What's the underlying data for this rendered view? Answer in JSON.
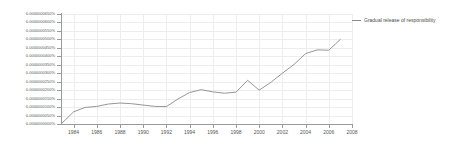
{
  "chart_data": {
    "type": "line",
    "title": "",
    "subtitle": "",
    "xlabel": "",
    "ylabel": "",
    "grid": true,
    "legend_position": "right",
    "xlim": [
      1983,
      2008
    ],
    "ylim": [
      0.0,
      6.5e-08
    ],
    "y_tick_labels": [
      "0.0000000650%",
      "0.0000000600%",
      "0.0000000550%",
      "0.0000000500%",
      "0.0000000450%",
      "0.0000000400%",
      "0.0000000350%",
      "0.0000000300%",
      "0.0000000250%",
      "0.0000000200%",
      "0.0000000150%",
      "0.0000000100%",
      "0.0000000050%",
      "0.0000000000%"
    ],
    "y_tick_values": [
      6.5e-08,
      6e-08,
      5.5e-08,
      5e-08,
      4.5e-08,
      4e-08,
      3.5e-08,
      3e-08,
      2.5e-08,
      2e-08,
      1.5e-08,
      1e-08,
      5e-09,
      0.0
    ],
    "x_tick_labels": [
      "1984",
      "1986",
      "1988",
      "1990",
      "1992",
      "1994",
      "1996",
      "1998",
      "2000",
      "2002",
      "2004",
      "2006",
      "2008"
    ],
    "x_tick_values": [
      1984,
      1986,
      1988,
      1990,
      1992,
      1994,
      1996,
      1998,
      2000,
      2002,
      2004,
      2006,
      2008
    ],
    "series": [
      {
        "name": "Gradual release of responsibility",
        "color": "#8a8a8a",
        "x": [
          1983,
          1984,
          1985,
          1986,
          1987,
          1988,
          1989,
          1990,
          1991,
          1992,
          1993,
          1994,
          1995,
          1996,
          1997,
          1998,
          1999,
          2000,
          2001,
          2002,
          2003,
          2004,
          2005,
          2006,
          2007
        ],
        "values": [
          5e-10,
          7.2e-09,
          9.8e-09,
          1.04e-08,
          1.18e-08,
          1.24e-08,
          1.2e-08,
          1.12e-08,
          1.04e-08,
          1.03e-08,
          1.48e-08,
          1.86e-08,
          2.03e-08,
          1.9e-08,
          1.82e-08,
          1.88e-08,
          2.58e-08,
          2e-08,
          2.46e-08,
          3e-08,
          3.52e-08,
          4.16e-08,
          4.38e-08,
          4.36e-08,
          5e-08
        ]
      }
    ]
  },
  "legend": {
    "entries": [
      {
        "label": "Gradual release of responsibility",
        "color": "#8a8a8a"
      }
    ]
  },
  "colors": {
    "line": "#8a8a8a",
    "grid": "#ededed",
    "axis": "#9a9a9a",
    "text": "#555555",
    "background": "#ffffff"
  }
}
